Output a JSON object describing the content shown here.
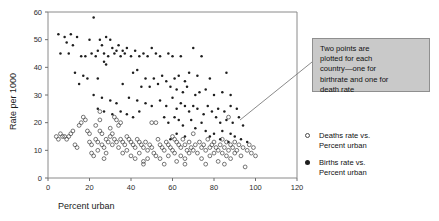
{
  "chart_data": {
    "type": "scatter",
    "title": "",
    "xlabel": "Percent urban",
    "ylabel": "Rate per 1000",
    "xlim": [
      0,
      120
    ],
    "ylim": [
      0,
      60
    ],
    "xticks": [
      0,
      20,
      40,
      60,
      80,
      100,
      120
    ],
    "yticks": [
      0,
      10,
      20,
      30,
      40,
      50,
      60
    ],
    "grid": false,
    "legend_position": "right",
    "series": [
      {
        "name": "Deaths rate vs. Percent urban",
        "marker": "open-circle",
        "color": "#4a4a4a",
        "points": [
          [
            4,
            15
          ],
          [
            5,
            14
          ],
          [
            6,
            16
          ],
          [
            7,
            15
          ],
          [
            8,
            15
          ],
          [
            9,
            14
          ],
          [
            10,
            15
          ],
          [
            11,
            16
          ],
          [
            12,
            17
          ],
          [
            13,
            12
          ],
          [
            14,
            11
          ],
          [
            15,
            19
          ],
          [
            16,
            20
          ],
          [
            17,
            22
          ],
          [
            18,
            21
          ],
          [
            19,
            17
          ],
          [
            20,
            16
          ],
          [
            20,
            13
          ],
          [
            21,
            12
          ],
          [
            21,
            9
          ],
          [
            22,
            8
          ],
          [
            23,
            19
          ],
          [
            23,
            14
          ],
          [
            24,
            13
          ],
          [
            24,
            10
          ],
          [
            25,
            24
          ],
          [
            25,
            21
          ],
          [
            25,
            17
          ],
          [
            26,
            16
          ],
          [
            26,
            12
          ],
          [
            27,
            11
          ],
          [
            27,
            7
          ],
          [
            28,
            14
          ],
          [
            28,
            9
          ],
          [
            29,
            13
          ],
          [
            30,
            18
          ],
          [
            30,
            15
          ],
          [
            31,
            16
          ],
          [
            31,
            12
          ],
          [
            32,
            22
          ],
          [
            32,
            14
          ],
          [
            33,
            21
          ],
          [
            33,
            13
          ],
          [
            34,
            19
          ],
          [
            34,
            11
          ],
          [
            35,
            20
          ],
          [
            35,
            14
          ],
          [
            36,
            13
          ],
          [
            36,
            9
          ],
          [
            37,
            12
          ],
          [
            38,
            15
          ],
          [
            38,
            10
          ],
          [
            39,
            14
          ],
          [
            40,
            13
          ],
          [
            40,
            8
          ],
          [
            41,
            12
          ],
          [
            42,
            11
          ],
          [
            42,
            7
          ],
          [
            43,
            14
          ],
          [
            44,
            13
          ],
          [
            44,
            9
          ],
          [
            45,
            12
          ],
          [
            46,
            11
          ],
          [
            46,
            6
          ],
          [
            47,
            13
          ],
          [
            48,
            10
          ],
          [
            48,
            7
          ],
          [
            49,
            12
          ],
          [
            50,
            20
          ],
          [
            50,
            11
          ],
          [
            51,
            9
          ],
          [
            52,
            20
          ],
          [
            52,
            8
          ],
          [
            53,
            14
          ],
          [
            54,
            12
          ],
          [
            54,
            7
          ],
          [
            55,
            11
          ],
          [
            56,
            10
          ],
          [
            57,
            13
          ],
          [
            58,
            12
          ],
          [
            58,
            8
          ],
          [
            59,
            11
          ],
          [
            60,
            15
          ],
          [
            60,
            10
          ],
          [
            61,
            14
          ],
          [
            61,
            9
          ],
          [
            62,
            13
          ],
          [
            62,
            6
          ],
          [
            63,
            12
          ],
          [
            64,
            11
          ],
          [
            64,
            8
          ],
          [
            65,
            14
          ],
          [
            66,
            12
          ],
          [
            66,
            7
          ],
          [
            67,
            10
          ],
          [
            68,
            13
          ],
          [
            68,
            9
          ],
          [
            69,
            11
          ],
          [
            70,
            16
          ],
          [
            70,
            10
          ],
          [
            71,
            12
          ],
          [
            72,
            9
          ],
          [
            73,
            13
          ],
          [
            74,
            11
          ],
          [
            74,
            7
          ],
          [
            75,
            12
          ],
          [
            76,
            10
          ],
          [
            77,
            14
          ],
          [
            78,
            11
          ],
          [
            78,
            8
          ],
          [
            79,
            12
          ],
          [
            80,
            13
          ],
          [
            80,
            9
          ],
          [
            81,
            11
          ],
          [
            82,
            10
          ],
          [
            82,
            6
          ],
          [
            83,
            12
          ],
          [
            84,
            14
          ],
          [
            84,
            9
          ],
          [
            85,
            11
          ],
          [
            86,
            13
          ],
          [
            86,
            8
          ],
          [
            87,
            10
          ],
          [
            88,
            12
          ],
          [
            88,
            7
          ],
          [
            89,
            11
          ],
          [
            90,
            13
          ],
          [
            90,
            9
          ],
          [
            91,
            10
          ],
          [
            92,
            12
          ],
          [
            93,
            8
          ],
          [
            94,
            11
          ],
          [
            95,
            4
          ],
          [
            96,
            10
          ],
          [
            97,
            12
          ],
          [
            98,
            9
          ],
          [
            99,
            11
          ],
          [
            100,
            8
          ],
          [
            87,
            22
          ],
          [
            85,
            5
          ],
          [
            76,
            5
          ],
          [
            66,
            5
          ],
          [
            56,
            5
          ],
          [
            46,
            5
          ]
        ]
      },
      {
        "name": "Births rate vs. Percent urban",
        "marker": "filled-dot",
        "color": "#1e1e1e",
        "points": [
          [
            22,
            58
          ],
          [
            5,
            52
          ],
          [
            11,
            52
          ],
          [
            8,
            51
          ],
          [
            14,
            51
          ],
          [
            20,
            50
          ],
          [
            25,
            50
          ],
          [
            28,
            51
          ],
          [
            30,
            50
          ],
          [
            9,
            49
          ],
          [
            12,
            48
          ],
          [
            26,
            48
          ],
          [
            31,
            47
          ],
          [
            34,
            48
          ],
          [
            36,
            46
          ],
          [
            38,
            47
          ],
          [
            6,
            45
          ],
          [
            10,
            45
          ],
          [
            16,
            44
          ],
          [
            18,
            44
          ],
          [
            21,
            45
          ],
          [
            23,
            44
          ],
          [
            24,
            46
          ],
          [
            27,
            45
          ],
          [
            29,
            44
          ],
          [
            32,
            45
          ],
          [
            33,
            46
          ],
          [
            35,
            44
          ],
          [
            37,
            45
          ],
          [
            40,
            44
          ],
          [
            42,
            46
          ],
          [
            44,
            44
          ],
          [
            46,
            45
          ],
          [
            48,
            44
          ],
          [
            50,
            47
          ],
          [
            52,
            45
          ],
          [
            54,
            44
          ],
          [
            58,
            45
          ],
          [
            60,
            44
          ],
          [
            64,
            44
          ],
          [
            70,
            47
          ],
          [
            74,
            44
          ],
          [
            13,
            38
          ],
          [
            17,
            37
          ],
          [
            19,
            36
          ],
          [
            24,
            36
          ],
          [
            27,
            42
          ],
          [
            28,
            41
          ],
          [
            41,
            38
          ],
          [
            43,
            39
          ],
          [
            47,
            36
          ],
          [
            51,
            36
          ],
          [
            55,
            37
          ],
          [
            57,
            35
          ],
          [
            61,
            36
          ],
          [
            63,
            37
          ],
          [
            66,
            35
          ],
          [
            68,
            38
          ],
          [
            72,
            37
          ],
          [
            78,
            36
          ],
          [
            86,
            38
          ],
          [
            15,
            34
          ],
          [
            36,
            34
          ],
          [
            45,
            33
          ],
          [
            49,
            33
          ],
          [
            53,
            34
          ],
          [
            59,
            33
          ],
          [
            62,
            32
          ],
          [
            65,
            31
          ],
          [
            67,
            33
          ],
          [
            71,
            30
          ],
          [
            73,
            31
          ],
          [
            76,
            32
          ],
          [
            80,
            30
          ],
          [
            84,
            31
          ],
          [
            88,
            30
          ],
          [
            22,
            30
          ],
          [
            26,
            29
          ],
          [
            30,
            28
          ],
          [
            33,
            27
          ],
          [
            39,
            29
          ],
          [
            43,
            28
          ],
          [
            47,
            27
          ],
          [
            50,
            26
          ],
          [
            54,
            28
          ],
          [
            57,
            26
          ],
          [
            60,
            29
          ],
          [
            62,
            25
          ],
          [
            64,
            27
          ],
          [
            66,
            26
          ],
          [
            68,
            24
          ],
          [
            70,
            26
          ],
          [
            72,
            25
          ],
          [
            75,
            23
          ],
          [
            77,
            26
          ],
          [
            79,
            24
          ],
          [
            82,
            25
          ],
          [
            85,
            24
          ],
          [
            88,
            26
          ],
          [
            91,
            25
          ],
          [
            24,
            25
          ],
          [
            27,
            24
          ],
          [
            31,
            23
          ],
          [
            35,
            24
          ],
          [
            38,
            23
          ],
          [
            41,
            22
          ],
          [
            44,
            24
          ],
          [
            56,
            22
          ],
          [
            61,
            22
          ],
          [
            63,
            21
          ],
          [
            69,
            21
          ],
          [
            74,
            20
          ],
          [
            81,
            22
          ],
          [
            83,
            20
          ],
          [
            86,
            21
          ],
          [
            89,
            20
          ],
          [
            92,
            22
          ],
          [
            94,
            19
          ],
          [
            58,
            20
          ],
          [
            65,
            19
          ],
          [
            71,
            18
          ],
          [
            76,
            17
          ],
          [
            78,
            15
          ],
          [
            80,
            16
          ],
          [
            83,
            14
          ],
          [
            87,
            13
          ],
          [
            90,
            15
          ],
          [
            93,
            14
          ],
          [
            96,
            13
          ],
          [
            62,
            16
          ],
          [
            66,
            15
          ],
          [
            59,
            14
          ],
          [
            84,
            17
          ],
          [
            88,
            16
          ]
        ]
      }
    ],
    "annotation": {
      "text": "Two points are\nplotted for each\ncountry—one for\nbirthrate and one for\ndeath rate",
      "leader_from": [
        240,
        120
      ],
      "leader_to": [
        312,
        62
      ],
      "box_color": "#c9c9c9"
    }
  },
  "legend": {
    "entries": [
      {
        "marker": "open-circle",
        "label": "Deaths rate vs.\nPercent urban"
      },
      {
        "marker": "filled-dot",
        "label": "Births rate vs.\nPercent urban"
      }
    ]
  }
}
